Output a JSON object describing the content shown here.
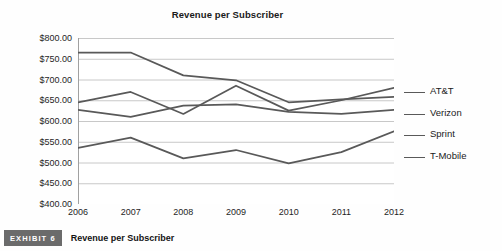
{
  "exhibit": {
    "badge_label": "EXHIBIT 6",
    "caption": "Revenue per Subscriber"
  },
  "chart_data": {
    "type": "line",
    "title": "Revenue per Subscriber",
    "xlabel": "",
    "ylabel": "",
    "categories": [
      "2006",
      "2007",
      "2008",
      "2009",
      "2010",
      "2011",
      "2012"
    ],
    "x_tick_labels": [
      "2006",
      "2007",
      "2008",
      "2009",
      "2010",
      "2011",
      "2012"
    ],
    "y_tick_labels": [
      "$800.00",
      "$750.00",
      "$700.00",
      "$650.00",
      "$600.00",
      "$550.00",
      "$500.00",
      "$450.00",
      "$400.00"
    ],
    "y_tick_values": [
      800,
      750,
      700,
      650,
      600,
      550,
      500,
      450,
      400
    ],
    "ylim": [
      400,
      800
    ],
    "grid": true,
    "grid_axis": "y",
    "legend_position": "right",
    "line_color": "#595959",
    "grid_color": "#c8c8c8",
    "axis_color": "#a0a0a0",
    "series": [
      {
        "name": "AT&T",
        "values": [
          765,
          765,
          710,
          698,
          645,
          652,
          658
        ]
      },
      {
        "name": "Verizon",
        "values": [
          627,
          610,
          637,
          640,
          622,
          617,
          627
        ]
      },
      {
        "name": "Sprint",
        "values": [
          645,
          670,
          617,
          685,
          625,
          650,
          680
        ]
      },
      {
        "name": "T-Mobile",
        "values": [
          535,
          560,
          510,
          530,
          498,
          525,
          575
        ]
      }
    ]
  }
}
